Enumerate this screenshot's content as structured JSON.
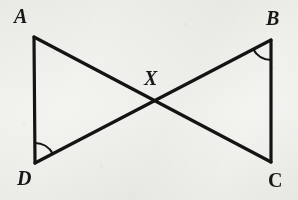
{
  "figure": {
    "width": 298,
    "height": 200,
    "background_color": "#f7f7f5",
    "stroke_color": "#141414",
    "stroke_width": 3.2,
    "arc_stroke_width": 2.2
  },
  "labels": {
    "a": "A",
    "b": "B",
    "c": "C",
    "d": "D",
    "x": "X"
  },
  "points": {
    "A": {
      "x": 34,
      "y": 37
    },
    "B": {
      "x": 271,
      "y": 40
    },
    "C": {
      "x": 271,
      "y": 162
    },
    "D": {
      "x": 35,
      "y": 163
    },
    "X": {
      "x": 152,
      "y": 103
    }
  },
  "label_positions": {
    "A": {
      "x": 14,
      "y": 6
    },
    "B": {
      "x": 266,
      "y": 8
    },
    "C": {
      "x": 268,
      "y": 170
    },
    "D": {
      "x": 17,
      "y": 168
    },
    "X": {
      "x": 144,
      "y": 68
    }
  },
  "segments": [
    {
      "name": "segment-AD",
      "from": "A",
      "to": "D"
    },
    {
      "name": "segment-BC",
      "from": "B",
      "to": "C"
    },
    {
      "name": "segment-AC",
      "from": "A",
      "to": "C"
    },
    {
      "name": "segment-DB",
      "from": "D",
      "to": "B"
    }
  ],
  "angle_marks": [
    {
      "name": "angle-arc-d",
      "vertex": "D",
      "radius": 20
    },
    {
      "name": "angle-arc-b",
      "vertex": "B",
      "radius": 20
    }
  ],
  "chart_data": {
    "type": "diagram",
    "shape": "bowtie / hourglass of two triangles ADX and BCX",
    "vertices": [
      {
        "label": "A",
        "x": 34,
        "y": 37
      },
      {
        "label": "B",
        "x": 271,
        "y": 40
      },
      {
        "label": "C",
        "x": 271,
        "y": 162
      },
      {
        "label": "D",
        "x": 35,
        "y": 163
      },
      {
        "label": "X",
        "x": 152,
        "y": 103
      }
    ],
    "edges": [
      {
        "from": "A",
        "to": "D"
      },
      {
        "from": "B",
        "to": "C"
      },
      {
        "from": "A",
        "to": "C"
      },
      {
        "from": "D",
        "to": "B"
      }
    ],
    "marked_angles": [
      "D",
      "B"
    ],
    "intersection_point": "X"
  }
}
